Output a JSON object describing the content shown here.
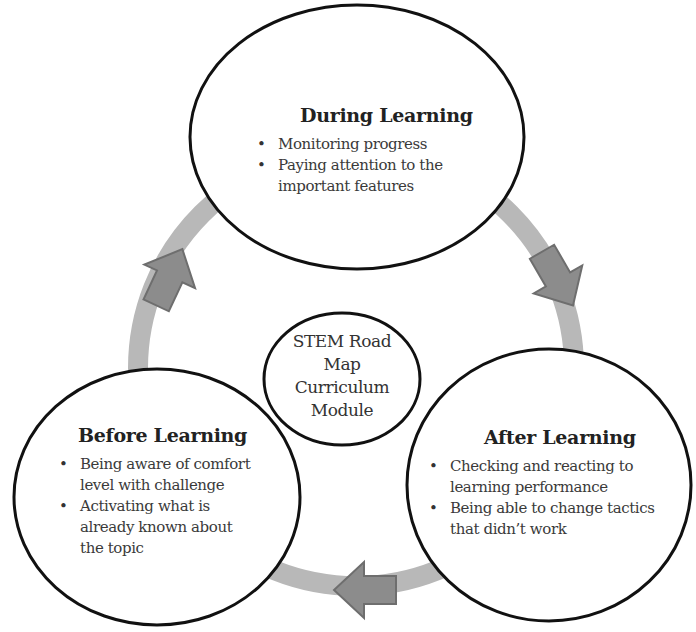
{
  "diagram": {
    "type": "cycle",
    "colors": {
      "ring": "#b8b8b8",
      "arrow_fill": "#8c8c8c",
      "arrow_stroke": "#6e6e6e",
      "node_stroke": "#111111",
      "node_fill": "#ffffff"
    },
    "center": {
      "lines": [
        "STEM Road",
        "Map",
        "Curriculum",
        "Module"
      ]
    },
    "nodes": [
      {
        "id": "during",
        "title": "During Learning",
        "bullets": [
          "Monitoring progress",
          "Paying attention to the important features"
        ]
      },
      {
        "id": "after",
        "title": "After Learning",
        "bullets": [
          "Checking and reacting to learning performance",
          "Being able to change tactics that didn’t work"
        ]
      },
      {
        "id": "before",
        "title": "Before Learning",
        "bullets": [
          "Being aware of comfort level with challenge",
          "Activating what is already known about the topic"
        ]
      }
    ],
    "arrows": [
      {
        "from": "before",
        "to": "during",
        "direction": "up-right"
      },
      {
        "from": "during",
        "to": "after",
        "direction": "down-right"
      },
      {
        "from": "after",
        "to": "before",
        "direction": "left"
      }
    ]
  }
}
